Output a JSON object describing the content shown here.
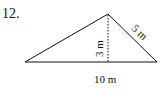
{
  "problem": {
    "number": "12.",
    "shape": "triangle",
    "labels": {
      "height": "3 m",
      "side": "5 m",
      "base": "10 m"
    }
  }
}
